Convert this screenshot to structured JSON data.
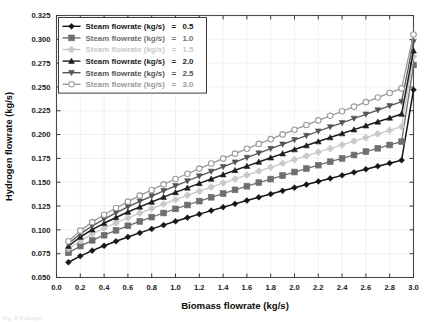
{
  "figure": {
    "caption_fragment": "Fig. 8  Hydrogen"
  },
  "axes": {
    "xlabel": "Biomass flowrate (kg/s)",
    "ylabel": "Hydrogen flowrate (kg/s)",
    "xticks": [
      "0.0",
      "0.2",
      "0.4",
      "0.6",
      "0.8",
      "1.0",
      "1.2",
      "1.4",
      "1.6",
      "1.8",
      "2.0",
      "2.2",
      "2.4",
      "2.6",
      "2.8",
      "3.0"
    ],
    "yticks": [
      "0.050",
      "0.075",
      "0.100",
      "0.125",
      "0.150",
      "0.175",
      "0.200",
      "0.225",
      "0.250",
      "0.275",
      "0.300",
      "0.325"
    ]
  },
  "legend": {
    "entries": [
      {
        "label": "Steam flowrate (kg/s)",
        "eq": "=",
        "value": "0.5",
        "marker": "diamond-filled-icon",
        "color": "#151515"
      },
      {
        "label": "Steam flowrate (kg/s)",
        "eq": "=",
        "value": "1.0",
        "marker": "square-filled-icon",
        "color": "#6e6e6e"
      },
      {
        "label": "Steam flowrate (kg/s)",
        "eq": "=",
        "value": "1.5",
        "marker": "plus-filled-icon",
        "color": "#c8c8c8"
      },
      {
        "label": "Steam flowrate (kg/s)",
        "eq": "=",
        "value": "2.0",
        "marker": "triangle-up-filled-icon",
        "color": "#1d1d1d"
      },
      {
        "label": "Steam flowrate (kg/s)",
        "eq": "=",
        "value": "2.5",
        "marker": "triangle-down-filled-icon",
        "color": "#545454"
      },
      {
        "label": "Steam flowrate (kg/s)",
        "eq": "=",
        "value": "3.0",
        "marker": "circle-open-icon",
        "color": "#9a9a9a"
      }
    ]
  },
  "chart_data": {
    "type": "line",
    "title": "",
    "xlabel": "Biomass flowrate (kg/s)",
    "ylabel": "Hydrogen flowrate (kg/s)",
    "xlim": [
      0.0,
      3.0
    ],
    "ylim": [
      0.05,
      0.325
    ],
    "grid": true,
    "legend_position": "upper-left",
    "x": [
      0.1,
      0.2,
      0.3,
      0.4,
      0.5,
      0.6,
      0.7,
      0.8,
      0.9,
      1.0,
      1.1,
      1.2,
      1.3,
      1.4,
      1.5,
      1.6,
      1.7,
      1.8,
      1.9,
      2.0,
      2.1,
      2.2,
      2.3,
      2.4,
      2.5,
      2.6,
      2.7,
      2.8,
      2.9,
      3.0
    ],
    "series": [
      {
        "name": "Steam flowrate (kg/s) = 0.5",
        "steam_flowrate": 0.5,
        "marker": "diamond-filled",
        "color": "#151515",
        "values": [
          0.066,
          0.0725,
          0.0782,
          0.0833,
          0.088,
          0.0925,
          0.0968,
          0.101,
          0.105,
          0.109,
          0.1128,
          0.1165,
          0.1202,
          0.1238,
          0.1273,
          0.1308,
          0.1342,
          0.1376,
          0.141,
          0.1443,
          0.1476,
          0.1508,
          0.154,
          0.1572,
          0.1604,
          0.1636,
          0.1668,
          0.17,
          0.1731,
          0.247
        ]
      },
      {
        "name": "Steam flowrate (kg/s) = 1.0",
        "steam_flowrate": 1.0,
        "marker": "square-filled",
        "color": "#6e6e6e",
        "values": [
          0.076,
          0.083,
          0.089,
          0.0944,
          0.0995,
          0.1043,
          0.1089,
          0.1134,
          0.1177,
          0.122,
          0.1261,
          0.1302,
          0.1342,
          0.1381,
          0.142,
          0.1458,
          0.1496,
          0.1533,
          0.157,
          0.1607,
          0.1643,
          0.1679,
          0.1715,
          0.175,
          0.1786,
          0.1821,
          0.1856,
          0.1891,
          0.1926,
          0.273
        ]
      },
      {
        "name": "Steam flowrate (kg/s) = 1.5",
        "steam_flowrate": 1.5,
        "marker": "plus-filled",
        "color": "#c8c8c8",
        "values": [
          0.08,
          0.0885,
          0.0955,
          0.1016,
          0.1072,
          0.1125,
          0.1175,
          0.1224,
          0.1271,
          0.1317,
          0.1362,
          0.1406,
          0.1449,
          0.1492,
          0.1534,
          0.1575,
          0.1616,
          0.1657,
          0.1697,
          0.1737,
          0.1776,
          0.1815,
          0.1854,
          0.1892,
          0.1931,
          0.1969,
          0.2007,
          0.2045,
          0.2083,
          0.282
        ]
      },
      {
        "name": "Steam flowrate (kg/s) = 2.0",
        "steam_flowrate": 2.0,
        "marker": "triangle-up-filled",
        "color": "#1d1d1d",
        "values": [
          0.083,
          0.0925,
          0.1002,
          0.1069,
          0.113,
          0.1187,
          0.1241,
          0.1293,
          0.1344,
          0.1393,
          0.1441,
          0.1488,
          0.1534,
          0.158,
          0.1625,
          0.1669,
          0.1713,
          0.1757,
          0.18,
          0.1843,
          0.1885,
          0.1927,
          0.1969,
          0.2011,
          0.2052,
          0.2093,
          0.2134,
          0.2175,
          0.2216,
          0.288
        ]
      },
      {
        "name": "Steam flowrate (kg/s) = 2.5",
        "steam_flowrate": 2.5,
        "marker": "triangle-down-filled",
        "color": "#545454",
        "values": [
          0.0855,
          0.0958,
          0.1041,
          0.1113,
          0.1179,
          0.1241,
          0.1299,
          0.1355,
          0.1409,
          0.1462,
          0.1513,
          0.1564,
          0.1613,
          0.1662,
          0.171,
          0.1758,
          0.1805,
          0.1852,
          0.1898,
          0.1944,
          0.1989,
          0.2035,
          0.208,
          0.2124,
          0.2169,
          0.2213,
          0.2257,
          0.2301,
          0.2345,
          0.2975
        ]
      },
      {
        "name": "Steam flowrate (kg/s) = 3.0",
        "steam_flowrate": 3.0,
        "marker": "circle-open",
        "color": "#9a9a9a",
        "values": [
          0.088,
          0.0992,
          0.1081,
          0.1159,
          0.123,
          0.1296,
          0.1359,
          0.1419,
          0.1477,
          0.1534,
          0.1589,
          0.1643,
          0.1696,
          0.1748,
          0.18,
          0.1851,
          0.1902,
          0.1952,
          0.2002,
          0.2051,
          0.21,
          0.2149,
          0.2197,
          0.2245,
          0.2293,
          0.2341,
          0.2389,
          0.2437,
          0.2485,
          0.305
        ]
      }
    ]
  }
}
